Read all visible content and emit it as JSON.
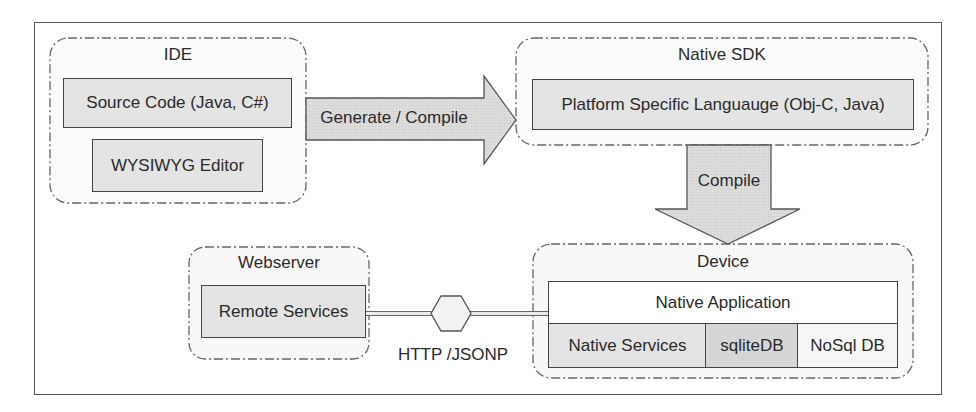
{
  "diagram": {
    "groups": {
      "ide": {
        "label": "IDE",
        "items": [
          "Source Code (Java, C#)",
          "WYSIWYG Editor"
        ]
      },
      "native_sdk": {
        "label": "Native SDK",
        "items": [
          "Platform Specific Languauge (Obj-C, Java)"
        ]
      },
      "webserver": {
        "label": "Webserver",
        "items": [
          "Remote Services"
        ]
      },
      "device": {
        "label": "Device",
        "app": "Native Application",
        "items": [
          "Native Services",
          "sqliteDB",
          "NoSql DB"
        ]
      }
    },
    "arrows": {
      "generate": "Generate / Compile",
      "compile": "Compile"
    },
    "connector": {
      "label": "HTTP /JSONP"
    }
  }
}
